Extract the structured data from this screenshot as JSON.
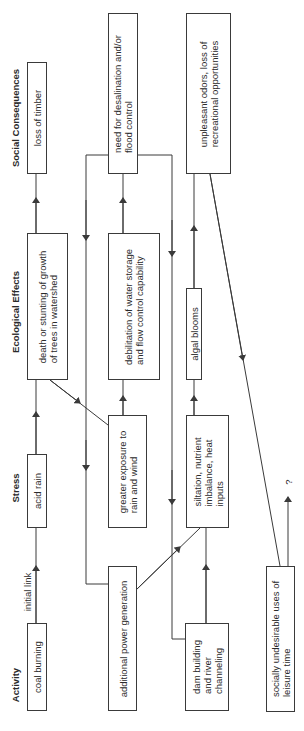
{
  "columns": {
    "activity": "Activity",
    "stress": "Stress",
    "ecological_effects": "Ecological Effects",
    "social_consequences": "Social Consequences"
  },
  "boxes": {
    "coal_burning": "coal burning",
    "acid_rain": "acid rain",
    "death_of_trees": "death or stunting of growth\nof trees in watershed",
    "loss_of_timber": "loss of timber",
    "additional_power": "additional power generation",
    "greater_exposure": "greater exposure to\nrain and wind",
    "debilitation": "debilitation of water storage\nand flow control capability",
    "desalination": "need for desalination and/or\nflood control",
    "dam_building": "dam building\nand river\nchanneling",
    "siltation": "siltation, nutrient\nimbalance, heat\ninputs",
    "algal_blooms": "algal blooms",
    "unpleasant_odors": "unpleasant odors, loss of\nrecreational opportunities",
    "leisure": "socially undesirable uses of\nleisure time"
  },
  "labels": {
    "initial_link": "initial link",
    "unknown": "?"
  },
  "colors": {
    "line": "#3a3a3a",
    "background": "#ffffff"
  }
}
